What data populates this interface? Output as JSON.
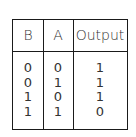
{
  "table": {
    "headers": [
      "B",
      "A",
      "Output"
    ],
    "rows": [
      [
        "0",
        "0",
        "1"
      ],
      [
        "0",
        "1",
        "1"
      ],
      [
        "1",
        "0",
        "1"
      ],
      [
        "1",
        "1",
        "0"
      ]
    ]
  }
}
